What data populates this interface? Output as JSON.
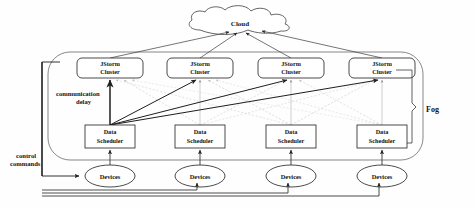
{
  "figure": {
    "background_color": "#fefefe",
    "line_color": "#2b2b2b"
  },
  "cloud": {
    "label": "Cloud",
    "cx": 240,
    "cy": 28
  },
  "tiers": {
    "fog": {
      "label": "Fog",
      "brace_x": 420,
      "container": {
        "x": 48,
        "y": 52,
        "w": 375,
        "h": 108
      }
    }
  },
  "annotations": {
    "communication_delay": "communication delay",
    "control_commands": "control commands"
  },
  "columns": [
    {
      "index": 0,
      "cluster": "JStorm Cluster",
      "scheduler": "Data Scheduler",
      "device": "Devices",
      "x": 110
    },
    {
      "index": 1,
      "cluster": "JStorm Cluster",
      "scheduler": "Data Scheduler",
      "device": "Devices",
      "x": 200
    },
    {
      "index": 2,
      "cluster": "JStorm Cluster",
      "scheduler": "Data Scheduler",
      "device": "Devices",
      "x": 291
    },
    {
      "index": 3,
      "cluster": "JStorm Cluster",
      "scheduler": "Data Scheduler",
      "device": "Devices",
      "x": 382
    }
  ],
  "cluster_row": {
    "label_line1": "JStorm",
    "label_line2": "Cluster",
    "y": 58,
    "w": 66,
    "h": 20
  },
  "scheduler_row": {
    "label_line1": "Data",
    "label_line2": "Scheduler",
    "y": 125,
    "w": 50,
    "h": 23
  },
  "device_row": {
    "label": "Devices",
    "cy": 176,
    "rx": 25,
    "ry": 11
  },
  "edges": {
    "cloud_to_cluster": 4,
    "scheduler_to_cluster_full_mesh": 16,
    "device_to_scheduler": 4,
    "control_bus_to_device": 4
  }
}
